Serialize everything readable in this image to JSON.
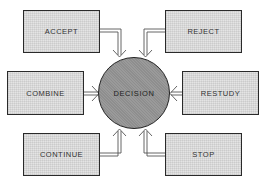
{
  "diagram": {
    "center": {
      "label": "DECISION"
    },
    "options": [
      {
        "id": "accept",
        "label": "ACCEPT",
        "position": "top-left"
      },
      {
        "id": "reject",
        "label": "REJECT",
        "position": "top-right"
      },
      {
        "id": "combine",
        "label": "COMBINE",
        "position": "middle-left"
      },
      {
        "id": "restudy",
        "label": "RESTUDY",
        "position": "middle-right"
      },
      {
        "id": "continue",
        "label": "CONTINUE",
        "position": "bottom-left"
      },
      {
        "id": "stop",
        "label": "STOP",
        "position": "bottom-right"
      }
    ],
    "colors": {
      "box_fill": "#e4e4e4",
      "circle_fill": "#9a9a9a",
      "outline": "#2a2a2a"
    }
  }
}
